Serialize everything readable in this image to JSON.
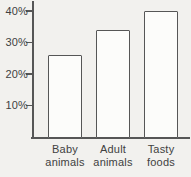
{
  "chart_data": {
    "type": "bar",
    "title": "",
    "xlabel": "",
    "ylabel": "",
    "categories": [
      "Baby animals",
      "Adult animals",
      "Tasty foods"
    ],
    "values": [
      26,
      34,
      40
    ],
    "value_unit": "%",
    "yticks": [
      {
        "value": 10,
        "label": "10%"
      },
      {
        "value": 20,
        "label": "20%"
      },
      {
        "value": 30,
        "label": "30%"
      },
      {
        "value": 40,
        "label": "40%"
      }
    ],
    "ylim": [
      0,
      43
    ],
    "grid": false,
    "legend": false,
    "colors": {
      "background": "#f2f1ee",
      "bar_fill": "#fcfcfa",
      "axis_line": "#565656",
      "text": "#414141"
    }
  }
}
